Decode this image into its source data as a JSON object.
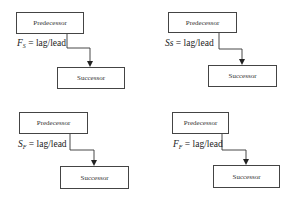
{
  "panels": [
    {
      "id": "finish-to-start",
      "predecessor": "Predecessor",
      "successor": "Successor",
      "rel_main": "F",
      "rel_sub": "S",
      "rel_rest": " = lag/lead"
    },
    {
      "id": "start-to-start",
      "predecessor": "Predecessor",
      "successor": "Successor",
      "rel_main": "S",
      "rel_sub": "s",
      "rel_rest": " = lag/lead"
    },
    {
      "id": "start-to-finish",
      "predecessor": "Predecessor",
      "successor": "Successor",
      "rel_main": "S",
      "rel_sub": "F",
      "rel_rest": " = lag/lead"
    },
    {
      "id": "finish-to-finish",
      "predecessor": "Predecessor",
      "successor": "Successor",
      "rel_main": "F",
      "rel_sub": "F",
      "rel_rest": " = lag/lead"
    }
  ]
}
